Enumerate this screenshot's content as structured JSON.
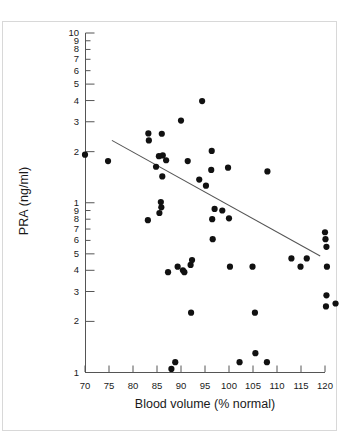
{
  "chart_data": {
    "type": "scatter",
    "title": "",
    "xlabel": "Blood volume (% normal)",
    "ylabel": "PRA (ng/ml)",
    "xlim": [
      70,
      120
    ],
    "ylim": [
      0.1,
      10
    ],
    "yscale": "log",
    "xscale": "linear",
    "grid": false,
    "legend": null,
    "xticks": [
      70,
      75,
      80,
      85,
      90,
      95,
      100,
      105,
      110,
      115,
      120
    ],
    "xtick_labels": [
      "70",
      "75",
      "80",
      "85",
      "90",
      "95",
      "100",
      "105",
      "110",
      "115",
      "120"
    ],
    "ytick_values": [
      10,
      9,
      8,
      7,
      6,
      5,
      4,
      3,
      2,
      1,
      0.9,
      0.8,
      0.7,
      0.6,
      0.5,
      0.4,
      0.3,
      0.2,
      0.1
    ],
    "ytick_labels": [
      "10",
      "9",
      "8",
      "7",
      "6",
      "5",
      "4",
      "3",
      "2",
      "1",
      "9",
      "8",
      "7",
      "6",
      "5",
      "4",
      "3",
      "2",
      "1"
    ],
    "ytick_major": [
      10,
      5,
      4,
      3,
      2,
      1,
      0.5,
      0.4,
      0.3,
      0.2,
      0.1
    ],
    "marker": "filled-circle",
    "marker_color": "#111111",
    "marker_size_px": 5,
    "points": [
      [
        70.0,
        1.92
      ],
      [
        74.8,
        1.76
      ],
      [
        83.2,
        2.56
      ],
      [
        83.3,
        2.33
      ],
      [
        83.1,
        0.79
      ],
      [
        84.8,
        1.63
      ],
      [
        85.4,
        1.88
      ],
      [
        85.5,
        0.87
      ],
      [
        85.8,
        1.01
      ],
      [
        85.9,
        0.94
      ],
      [
        86.0,
        2.55
      ],
      [
        86.1,
        1.43
      ],
      [
        86.2,
        1.9
      ],
      [
        86.9,
        1.78
      ],
      [
        87.3,
        0.39
      ],
      [
        88.0,
        0.105
      ],
      [
        88.8,
        0.115
      ],
      [
        89.3,
        0.42
      ],
      [
        90.0,
        3.05
      ],
      [
        90.4,
        0.4
      ],
      [
        90.7,
        0.39
      ],
      [
        91.4,
        1.76
      ],
      [
        92.0,
        0.43
      ],
      [
        92.1,
        0.225
      ],
      [
        92.3,
        0.46
      ],
      [
        93.8,
        1.37
      ],
      [
        94.4,
        3.97
      ],
      [
        95.2,
        1.26
      ],
      [
        96.4,
        2.02
      ],
      [
        96.3,
        1.56
      ],
      [
        96.5,
        0.8
      ],
      [
        96.6,
        0.61
      ],
      [
        97.0,
        0.92
      ],
      [
        98.6,
        0.9
      ],
      [
        99.8,
        1.61
      ],
      [
        100.0,
        0.81
      ],
      [
        100.2,
        0.42
      ],
      [
        102.2,
        0.115
      ],
      [
        104.9,
        0.42
      ],
      [
        105.4,
        0.225
      ],
      [
        105.5,
        0.13
      ],
      [
        108.0,
        1.53
      ],
      [
        107.9,
        0.115
      ],
      [
        113.0,
        0.47
      ],
      [
        114.9,
        0.42
      ],
      [
        116.2,
        0.47
      ],
      [
        120.0,
        0.67
      ],
      [
        120.1,
        0.61
      ],
      [
        120.3,
        0.55
      ],
      [
        120.4,
        0.42
      ],
      [
        120.3,
        0.285
      ],
      [
        120.2,
        0.245
      ],
      [
        122.2,
        0.255
      ]
    ],
    "trendline": {
      "x_start": 75.6,
      "y_start": 2.33,
      "x_end": 119.0,
      "y_end": 0.485,
      "color": "#555555",
      "width_px": 1.1
    }
  }
}
